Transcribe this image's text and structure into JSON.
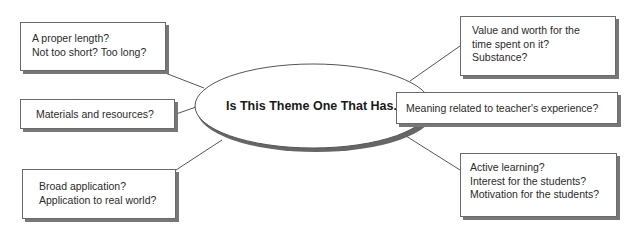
{
  "center": {
    "label": "Is This Theme One That Has..."
  },
  "nodes": [
    {
      "id": "length",
      "lines": [
        "A proper length?",
        "Not too short? Too long?"
      ]
    },
    {
      "id": "materials",
      "lines": [
        "Materials and resources?"
      ]
    },
    {
      "id": "application",
      "lines": [
        "Broad application?",
        "Application to real world?"
      ]
    },
    {
      "id": "value",
      "lines": [
        "Value and worth for the",
        "time spent on it?",
        "Substance?"
      ]
    },
    {
      "id": "meaning",
      "lines": [
        "Meaning related to teacher's experience?"
      ]
    },
    {
      "id": "active",
      "lines": [
        "Active learning?",
        "Interest for the students?",
        "Motivation for the students?"
      ]
    }
  ],
  "colors": {
    "stroke": "#555555",
    "shadow": "#777777",
    "background": "#ffffff"
  }
}
